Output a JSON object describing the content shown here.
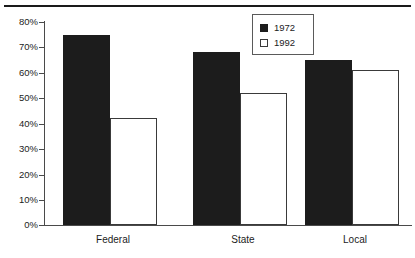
{
  "chart_data": {
    "type": "bar",
    "title": "",
    "xlabel": "",
    "ylabel": "",
    "categories": [
      "Federal",
      "State",
      "Local"
    ],
    "series": [
      {
        "name": "1972",
        "values": [
          75,
          68,
          65
        ],
        "style": "filled",
        "color": "#1c1c1c"
      },
      {
        "name": "1992",
        "values": [
          42,
          52,
          61
        ],
        "style": "hollow",
        "color": "#ffffff"
      }
    ],
    "ylim": [
      0,
      80
    ],
    "ytick_values": [
      0,
      10,
      20,
      30,
      40,
      50,
      60,
      70,
      80
    ],
    "ytick_labels": [
      "0%",
      "10%",
      "20%",
      "30%",
      "40%",
      "50%",
      "60%",
      "70%",
      "80%"
    ],
    "grid": false,
    "legend_position": "top-right",
    "legend_entries": [
      "1972",
      "1992"
    ]
  },
  "legend": {
    "entries": [
      {
        "label": "1972",
        "swatch": "filled-square-icon"
      },
      {
        "label": "1992",
        "swatch": "hollow-square-icon"
      }
    ]
  },
  "axes": {
    "y_tick_labels": [
      "80%",
      "70%",
      "60%",
      "50%",
      "40%",
      "30%",
      "20%",
      "10%",
      "0%"
    ],
    "x_category_labels": [
      "Federal",
      "State",
      "Local"
    ]
  },
  "colors": {
    "series_1972": "#1c1c1c",
    "series_1992": "#ffffff",
    "axis": "#4a4a4a",
    "text": "#1c1c1c",
    "rule": "#1a1a1a"
  }
}
